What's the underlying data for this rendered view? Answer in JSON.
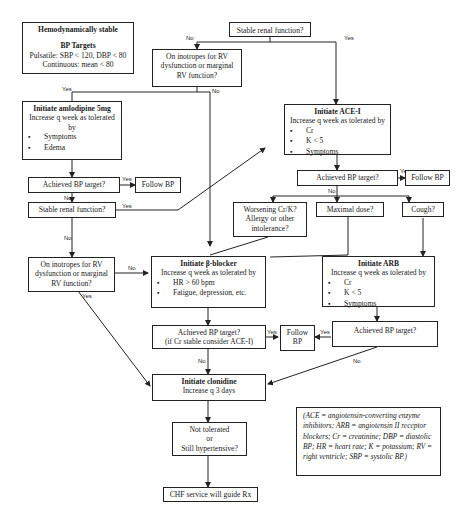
{
  "start": {
    "title": "Hemodynamically stable",
    "targets_title": "BP Targets",
    "pulsatile": "Pulsatile: SBP < 120, DBP < 80",
    "continuous": "Continuous: mean < 80"
  },
  "stable_renal_top": "Stable renal function?",
  "inotropes_top": "On inotropes for RV dysfunction or marginal RV function?",
  "amlodipine": {
    "title": "Initiate amlodipine 5mg",
    "subtitle": "Increase q week as tolerated by",
    "items": [
      "Symptoms",
      "Edema"
    ]
  },
  "amlo_bp": "Achieved BP target?",
  "amlo_follow": "Follow BP",
  "stable_renal_mid": "Stable renal function?",
  "inotropes_mid": "On inotropes for RV dysfunction or marginal RV function?",
  "ace": {
    "title": "Initiate ACE-I",
    "subtitle": "Increase q week as tolerated by",
    "items": [
      "Cr",
      "K < 5",
      "Symptoms"
    ]
  },
  "ace_bp": "Achieved BP target?",
  "ace_follow": "Follow BP",
  "worsening": "Worsening Cr/K? Allergy or other intolerance?",
  "maximal": "Maximal dose?",
  "cough": "Cough?",
  "beta": {
    "title": "Initiate β-blocker",
    "subtitle": "Increase q week as tolerated by",
    "items": [
      "HR > 60 bpm",
      "Fatigue, depression, etc."
    ]
  },
  "arb": {
    "title": "Initiate ARB",
    "subtitle": "Increase q week as tolerated by",
    "items": [
      "Cr",
      "K < 5",
      "Symptoms"
    ]
  },
  "beta_bp": {
    "line1": "Achieved BP target?",
    "line2": "(if Cr stable consider ACE-I)"
  },
  "follow_center": "Follow BP",
  "arb_bp": "Achieved BP target?",
  "clonidine": {
    "title": "Initiate clonidine",
    "subtitle": "Increase q 3 days"
  },
  "not_tolerated": {
    "line1": "Not tolerated",
    "line2": "or",
    "line3": "Still hypertensive?"
  },
  "chf": "CHF service will guide Rx",
  "legend": "(ACE = angiotensin-converting enzyme inhibitors; ARB = angiotensin II receptor blockers; Cr = creatinine; DBP = diastolic BP; HR = heart rate; K = potassium; RV = right ventricle; SBP = systolic BP.)",
  "labels": {
    "yes": "Yes",
    "no": "No"
  }
}
